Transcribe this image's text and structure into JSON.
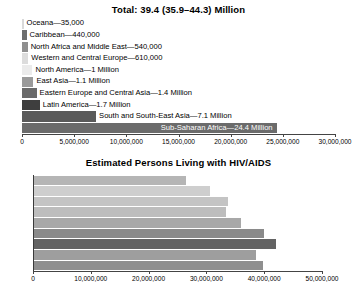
{
  "chart_data": [
    {
      "type": "bar",
      "orientation": "horizontal",
      "title": "Total: 39.4 (35.9–44.3) Million",
      "xlabel": "",
      "ylabel": "",
      "xlim": [
        0,
        30000000
      ],
      "xticks": [
        0,
        5000000,
        10000000,
        15000000,
        20000000,
        25000000,
        30000000
      ],
      "xticklabels": [
        "0",
        "5,000,000",
        "10,000,000",
        "15,000,000",
        "20,000,000",
        "25,000,000",
        "30,000,000"
      ],
      "grid": false,
      "legend": "none",
      "categories": [
        "Oceana",
        "Caribbean",
        "North Africa and Middle East",
        "Western and Central Europe",
        "North America",
        "East Asia",
        "Eastern Europe and Central Asia",
        "Latin America",
        "South and South-East Asia",
        "Sub-Saharan Africa"
      ],
      "values": [
        35000,
        440000,
        540000,
        610000,
        1000000,
        1100000,
        1400000,
        1700000,
        7100000,
        24400000
      ],
      "value_text": [
        "35,000",
        "440,000",
        "540,000",
        "610,000",
        "1 Million",
        "1.1 Million",
        "1.4 Million",
        "1.7 Million",
        "7.1 Million",
        "24.4 Million"
      ],
      "data_labels": [
        "Oceana—35,000",
        "Caribbean—440,000",
        "North Africa and Middle East—540,000",
        "Western and Central Europe—610,000",
        "North America—1 Million",
        "East Asia—1.1 Million",
        "Eastern Europe and Central Asia—1.4 Million",
        "Latin America—1.7 Million",
        "South and South-East Asia—7.1 Million",
        "Sub-Saharan Africa—24.4 Million"
      ],
      "bar_colors": [
        "#d9d9d9",
        "#6d6d6d",
        "#8f8f8f",
        "#dcdcdc",
        "#ebebeb",
        "#9a9a9a",
        "#6a6a6a",
        "#3e3e3e",
        "#5a5a5a",
        "#6b6b6b"
      ],
      "label_placement": [
        "outside",
        "outside",
        "outside",
        "outside",
        "outside",
        "outside",
        "outside",
        "outside",
        "outside",
        "inside"
      ]
    },
    {
      "type": "bar",
      "orientation": "horizontal",
      "title": "Estimated Persons Living with HIV/AIDS",
      "xlabel": "",
      "ylabel": "",
      "xlim": [
        0,
        50000000
      ],
      "xticks": [
        0,
        10000000,
        20000000,
        30000000,
        40000000,
        50000000
      ],
      "xticklabels": [
        "0",
        "10,000,000",
        "20,000,000",
        "30,000,000",
        "40,000,000",
        "50,000,000"
      ],
      "grid": false,
      "legend": "none",
      "categories": [
        "1996",
        "1997",
        "1998",
        "1999",
        "2000",
        "2001",
        "2002",
        "2003",
        "2004"
      ],
      "values": [
        26500000,
        30600000,
        33800000,
        33400000,
        36000000,
        40000000,
        42000000,
        38500000,
        39800000
      ],
      "bar_colors": [
        "#b5b5b5",
        "#cecece",
        "#c4c4c4",
        "#bdbdbd",
        "#a8a8a8",
        "#8a8a8a",
        "#636363",
        "#9e9e9e",
        "#8f8f8f"
      ]
    }
  ]
}
